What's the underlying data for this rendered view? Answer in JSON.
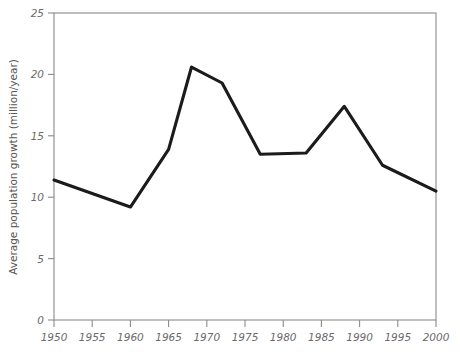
{
  "chart_data": {
    "type": "line",
    "title": "",
    "xlabel": "",
    "ylabel": "Average population growth (million/year)",
    "xlim": [
      1950,
      2000
    ],
    "ylim": [
      0,
      25
    ],
    "grid": false,
    "legend": null,
    "xticks": [
      "1950",
      "1955",
      "1960",
      "1965",
      "1970",
      "1975",
      "1980",
      "1985",
      "1990",
      "1995",
      "2000"
    ],
    "xtick_values": [
      1950,
      1955,
      1960,
      1965,
      1970,
      1975,
      1980,
      1985,
      1990,
      1995,
      2000
    ],
    "yticks": [
      "0",
      "5",
      "10",
      "15",
      "20",
      "25"
    ],
    "ytick_values": [
      0,
      5,
      10,
      15,
      20,
      25
    ],
    "series": [
      {
        "name": "Average population growth",
        "color": "#1b1b1b",
        "x": [
          1950,
          1960,
          1965,
          1968,
          1972,
          1977,
          1983,
          1988,
          1993,
          2000
        ],
        "values": [
          11.4,
          9.2,
          13.9,
          20.6,
          19.3,
          13.5,
          13.6,
          17.4,
          12.6,
          10.5
        ]
      }
    ]
  },
  "axes": {
    "y_label": "Average population growth (million/year)",
    "x_label": ""
  }
}
